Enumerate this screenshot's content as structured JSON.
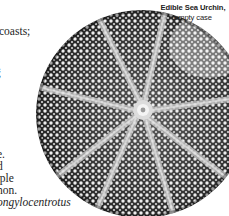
{
  "figure": {
    "caption_line1": "Edible Sea Urchin,",
    "caption_line2": "empty case"
  },
  "body_text": {
    "lines": [
      {
        "text": "coasts;",
        "top": 25,
        "left": 0,
        "italic": false
      },
      {
        "text": ".",
        "top": 60,
        "left": 0,
        "italic": false
      },
      {
        "text": ";",
        "top": 76,
        "left": 0,
        "italic": false
      },
      {
        "text": "e.",
        "top": 148,
        "left": 0,
        "italic": false
      },
      {
        "text": "d",
        "top": 160,
        "left": 0,
        "italic": false
      },
      {
        "text": "rple",
        "top": 172,
        "left": 0,
        "italic": false
      },
      {
        "text": "non.",
        "top": 184,
        "left": 0,
        "italic": false
      },
      {
        "text": "ongylocentrotus",
        "top": 196,
        "left": 0,
        "italic": true
      }
    ]
  },
  "colors": {
    "page": "#ffffff",
    "text": "#1e1e1e",
    "ink_dark": "#2a2a2a",
    "ink_mid": "#6f6f6f",
    "tubercle": "#ececec",
    "ambulacral": "#bdbdbd"
  }
}
